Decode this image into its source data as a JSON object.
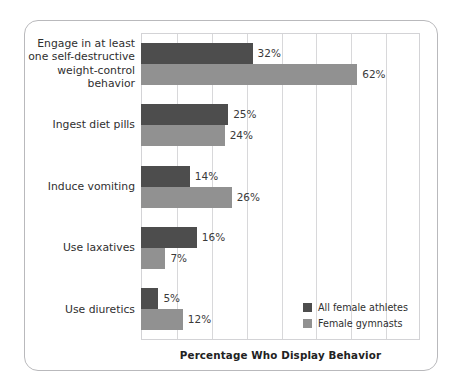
{
  "chart_data": {
    "type": "bar",
    "orientation": "horizontal",
    "title": "",
    "xlabel": "Percentage Who Display Behavior",
    "ylabel": "",
    "xlim": [
      0,
      80
    ],
    "xtick_interval": 10,
    "grid": true,
    "legend_position": "inside-bottom-right",
    "categories": [
      "Engage in at least one self-destructive weight-control behavior",
      "Ingest diet pills",
      "Induce vomiting",
      "Use laxatives",
      "Use diuretics"
    ],
    "category_lines": [
      [
        "Engage in at least",
        "one self-destructive",
        "weight-control",
        "behavior"
      ],
      [
        "Ingest diet pills"
      ],
      [
        "Induce vomiting"
      ],
      [
        "Use laxatives"
      ],
      [
        "Use diuretics"
      ]
    ],
    "series": [
      {
        "name": "All female athletes",
        "color": "#4d4d4d",
        "values": [
          32,
          25,
          14,
          16,
          5
        ],
        "labels": [
          "32%",
          "25%",
          "14%",
          "16%",
          "5%"
        ]
      },
      {
        "name": "Female gymnasts",
        "color": "#919191",
        "values": [
          62,
          24,
          26,
          7,
          12
        ],
        "labels": [
          "62%",
          "24%",
          "26%",
          "7%",
          "12%"
        ]
      }
    ]
  },
  "axis": {
    "x_title": "Percentage Who Display Behavior"
  },
  "legend": {
    "entries": [
      {
        "label": "All female athletes",
        "color": "#4d4d4d"
      },
      {
        "label": "Female gymnasts",
        "color": "#919191"
      }
    ]
  },
  "colors": {
    "series_dark": "#4d4d4d",
    "series_light": "#919191",
    "gridline": "#d8d8da",
    "frame_border": "#b9b9bc",
    "text": "#2f2f2f",
    "background": "#ffffff"
  }
}
